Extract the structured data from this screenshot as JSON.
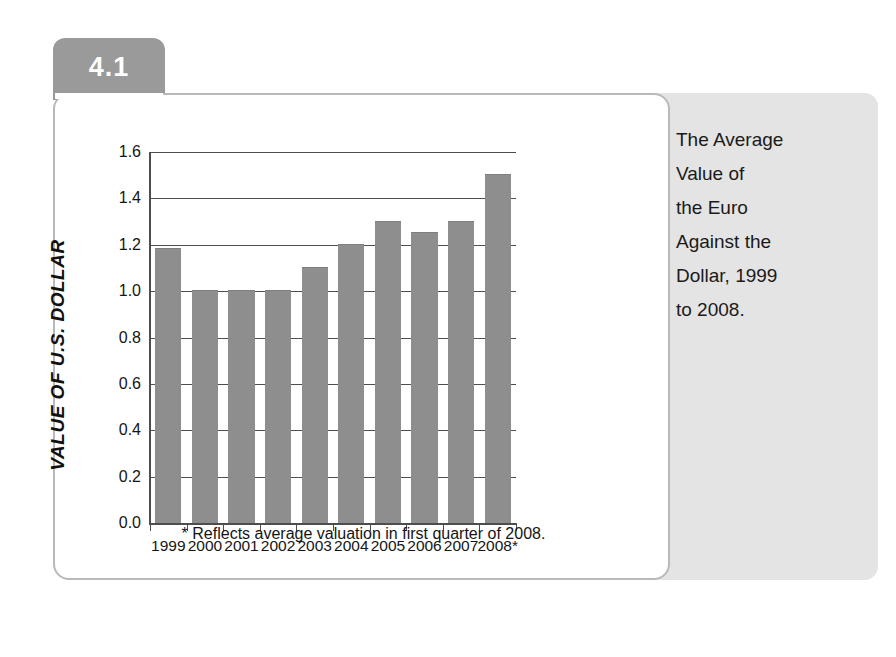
{
  "figure": {
    "number": "4.1",
    "caption": "The Average\nValue of\nthe Euro\nAgainst the\nDollar, 1999\nto 2008."
  },
  "colors": {
    "bar_fill": "#8e8e8e",
    "tab_background": "#9a9a9a",
    "caption_panel": "#e4e4e4",
    "axis": "#4d4d4d",
    "card_border": "#b9b9b9"
  },
  "chart_data": {
    "type": "bar",
    "title": "",
    "xlabel": "",
    "ylabel": "VALUE OF U.S. DOLLAR",
    "categories": [
      "1999",
      "2000",
      "2001",
      "2002",
      "2003",
      "2004",
      "2005",
      "2006",
      "2007",
      "2008*"
    ],
    "values": [
      1.18,
      1.0,
      1.0,
      1.0,
      1.1,
      1.2,
      1.3,
      1.25,
      1.3,
      1.5
    ],
    "ylim": [
      0.0,
      1.6
    ],
    "ytick_labels": [
      "1.6",
      "1.4",
      "1.2",
      "1.0",
      "0.8",
      "0.6",
      "0.4",
      "0.2",
      "0.0"
    ],
    "ytick_values": [
      1.6,
      1.4,
      1.2,
      1.0,
      0.8,
      0.6,
      0.4,
      0.2,
      0.0
    ],
    "grid": true,
    "legend": null,
    "footnote": "* Reflects average valuation in first quarter of 2008."
  }
}
